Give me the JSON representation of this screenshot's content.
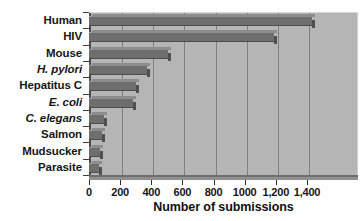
{
  "chart_data": {
    "type": "bar",
    "orientation": "horizontal",
    "title": "",
    "xlabel": "Number of submissions",
    "ylabel": "",
    "categories": [
      "Human",
      "HIV",
      "Mouse",
      "H. pylori",
      "Hepatitus C",
      "E. coli",
      "C. elegans",
      "Salmon",
      "Mudsucker",
      "Parasite"
    ],
    "categories_italic": [
      false,
      false,
      false,
      true,
      false,
      true,
      true,
      false,
      false,
      false
    ],
    "values": [
      1430,
      1190,
      505,
      375,
      300,
      285,
      95,
      85,
      70,
      65
    ],
    "xlim": [
      0,
      1540
    ],
    "xticks": [
      0,
      200,
      400,
      600,
      800,
      1000,
      1200,
      1400
    ],
    "xticklabels": [
      "0",
      "200",
      "400",
      "600",
      "800",
      "1000",
      "1,200",
      "1,400"
    ],
    "gridlines": "vertical",
    "grid": true,
    "legend": null,
    "colors": {
      "bar_fill": "#6e6e6e",
      "bar_top_edge": "#9c9c9c",
      "bar_side_face": "#4f4f4f",
      "plot_background": "#b5b5b5",
      "gridline": "#7e7e7e",
      "axis": "#4a4a4a",
      "text": "#161616",
      "page_background": "#ffffff"
    }
  }
}
